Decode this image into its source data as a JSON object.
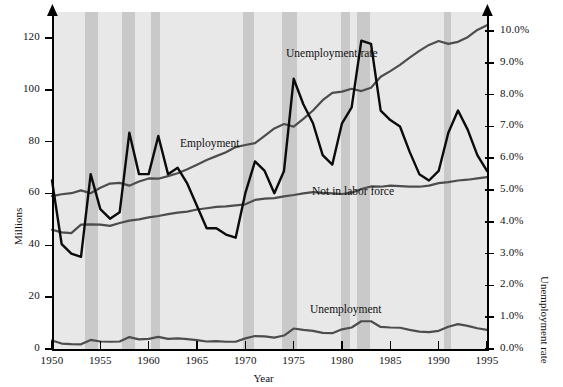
{
  "chart_data": {
    "type": "line",
    "title": "",
    "xlabel": "Year",
    "ylabel": "Millions",
    "y2label": "Unemployment rate",
    "xlim": [
      1950,
      1995
    ],
    "ylim": [
      0,
      130
    ],
    "y2lim": [
      0,
      10.6
    ],
    "grid": false,
    "legend_position": "inline-annotations",
    "xticks": [
      "1950",
      "1955",
      "1960",
      "1965",
      "1970",
      "1975",
      "1980",
      "1985",
      "1990",
      "1995"
    ],
    "yticks": [
      "0",
      "20",
      "40",
      "60",
      "80",
      "100",
      "120"
    ],
    "y2ticks": [
      "0.0%",
      "1.0%",
      "2.0%",
      "3.0%",
      "4.0%",
      "5.0%",
      "6.0%",
      "7.0%",
      "8.0%",
      "9.0%",
      "10.0%"
    ],
    "x": [
      1950,
      1951,
      1952,
      1953,
      1954,
      1955,
      1956,
      1957,
      1958,
      1959,
      1960,
      1961,
      1962,
      1963,
      1964,
      1965,
      1966,
      1967,
      1968,
      1969,
      1970,
      1971,
      1972,
      1973,
      1974,
      1975,
      1976,
      1977,
      1978,
      1979,
      1980,
      1981,
      1982,
      1983,
      1984,
      1985,
      1986,
      1987,
      1988,
      1989,
      1990,
      1991,
      1992,
      1993,
      1994,
      1995
    ],
    "series": [
      {
        "name": "Employment",
        "axis": "left",
        "units": "Millions",
        "color": "#4d4d4d",
        "values": [
          59.0,
          59.7,
          60.1,
          61.2,
          60.1,
          62.2,
          63.8,
          64.1,
          63.0,
          64.6,
          65.8,
          65.7,
          66.7,
          67.8,
          69.3,
          71.1,
          72.9,
          74.4,
          75.9,
          77.9,
          78.7,
          79.4,
          82.2,
          85.1,
          86.8,
          85.8,
          88.8,
          92.0,
          96.0,
          98.8,
          99.3,
          100.4,
          99.5,
          100.8,
          105.0,
          107.2,
          109.6,
          112.4,
          115.0,
          117.3,
          118.8,
          117.7,
          118.5,
          120.3,
          123.1,
          124.9
        ]
      },
      {
        "name": "Not in labor force",
        "axis": "left",
        "units": "Millions",
        "color": "#4d4d4d",
        "values": [
          46.0,
          45.0,
          44.7,
          48.0,
          48.1,
          48.0,
          47.5,
          48.6,
          49.5,
          50.0,
          50.8,
          51.3,
          52.0,
          52.6,
          53.0,
          53.8,
          54.3,
          54.8,
          55.0,
          55.4,
          55.8,
          57.5,
          58.0,
          58.2,
          58.9,
          59.4,
          60.0,
          60.5,
          60.2,
          60.0,
          59.8,
          60.3,
          61.7,
          62.7,
          62.6,
          63.0,
          62.8,
          62.6,
          62.6,
          63.0,
          64.0,
          64.4,
          65.0,
          65.3,
          65.8,
          66.3
        ]
      },
      {
        "name": "Unemployment",
        "axis": "left",
        "units": "Millions",
        "color": "#4d4d4d",
        "values": [
          3.3,
          2.1,
          1.9,
          1.8,
          3.5,
          2.9,
          2.8,
          2.9,
          4.6,
          3.7,
          3.9,
          4.7,
          3.9,
          4.1,
          3.8,
          3.4,
          2.9,
          3.0,
          2.8,
          2.8,
          4.1,
          5.0,
          4.9,
          4.4,
          5.2,
          7.9,
          7.4,
          7.0,
          6.2,
          6.1,
          7.6,
          8.3,
          10.7,
          10.7,
          8.5,
          8.3,
          8.2,
          7.4,
          6.7,
          6.5,
          7.0,
          8.6,
          9.6,
          8.9,
          8.0,
          7.4
        ]
      },
      {
        "name": "Unemployment rate",
        "axis": "right",
        "units": "%",
        "color": "#0b0b0b",
        "values": [
          5.3,
          3.3,
          3.0,
          2.9,
          5.5,
          4.4,
          4.1,
          4.3,
          6.8,
          5.5,
          5.5,
          6.7,
          5.5,
          5.7,
          5.2,
          4.5,
          3.8,
          3.8,
          3.6,
          3.5,
          4.9,
          5.9,
          5.6,
          4.9,
          5.6,
          8.5,
          7.7,
          7.1,
          6.1,
          5.8,
          7.1,
          7.6,
          9.7,
          9.6,
          7.5,
          7.2,
          7.0,
          6.2,
          5.5,
          5.3,
          5.6,
          6.8,
          7.5,
          6.9,
          6.1,
          5.6
        ]
      }
    ],
    "annotations": [
      {
        "text": "Employment",
        "x_px": 180,
        "y_px": 137
      },
      {
        "text": "Not in labor force",
        "x_px": 312,
        "y_px": 185
      },
      {
        "text": "Unemployment",
        "x_px": 310,
        "y_px": 303
      },
      {
        "text": "Unemployment rate",
        "x_px": 286,
        "y_px": 47
      }
    ],
    "recession_bands": [
      {
        "start": 1953.4,
        "end": 1954.8
      },
      {
        "start": 1957.2,
        "end": 1958.6
      },
      {
        "start": 1960.2,
        "end": 1961.2
      },
      {
        "start": 1969.8,
        "end": 1970.9
      },
      {
        "start": 1973.8,
        "end": 1975.3
      },
      {
        "start": 1979.9,
        "end": 1980.8
      },
      {
        "start": 1981.5,
        "end": 1982.9
      },
      {
        "start": 1990.5,
        "end": 1991.3
      }
    ],
    "colors": {
      "plot_background": "#e8e8e8",
      "recession_band": "#c9c9c9",
      "gray_series": "#4d4d4d",
      "black_series": "#0b0b0b",
      "axis": "#000000"
    }
  }
}
